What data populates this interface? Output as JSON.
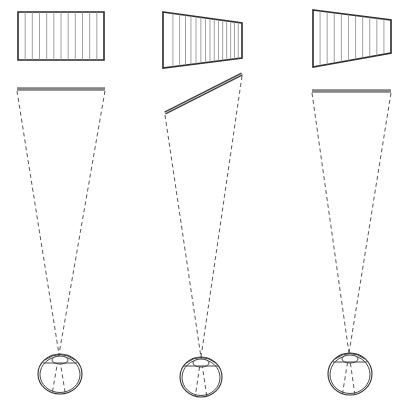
{
  "figure": {
    "colors": {
      "line": "#2a2a2a",
      "stripe": "#8a8a8a",
      "background": "#ffffff"
    },
    "panels": [
      {
        "id": "frontal",
        "image_shape": {
          "points": [
            [
              18,
              12
            ],
            [
              104,
              12
            ],
            [
              104,
              60
            ],
            [
              18,
              60
            ]
          ],
          "stripes": 12
        },
        "object_bar": {
          "x1": 17,
          "y1": 89,
          "x2": 105,
          "y2": 89
        },
        "eye": {
          "cx": 60,
          "cy": 374,
          "rx": 22,
          "ry": 20,
          "nodal": [
            59,
            354
          ]
        }
      },
      {
        "id": "slanted-object",
        "image_shape": {
          "points": [
            [
              163,
              12
            ],
            [
              242,
              23
            ],
            [
              242,
              58
            ],
            [
              163,
              68
            ]
          ],
          "stripes": 16
        },
        "object_bar": {
          "x1": 165,
          "y1": 113,
          "x2": 242,
          "y2": 74
        },
        "eye": {
          "cx": 201,
          "cy": 377,
          "rx": 21,
          "ry": 20,
          "nodal": [
            201,
            357
          ]
        }
      },
      {
        "id": "frontal-trapezoid",
        "image_shape": {
          "points": [
            [
              313,
              10
            ],
            [
              391,
              20
            ],
            [
              391,
              53
            ],
            [
              313,
              67
            ]
          ],
          "stripes": 11
        },
        "object_bar": {
          "x1": 312,
          "y1": 91,
          "x2": 391,
          "y2": 91
        },
        "eye": {
          "cx": 350,
          "cy": 374,
          "rx": 22,
          "ry": 21,
          "nodal": [
            349,
            353
          ]
        }
      }
    ]
  }
}
